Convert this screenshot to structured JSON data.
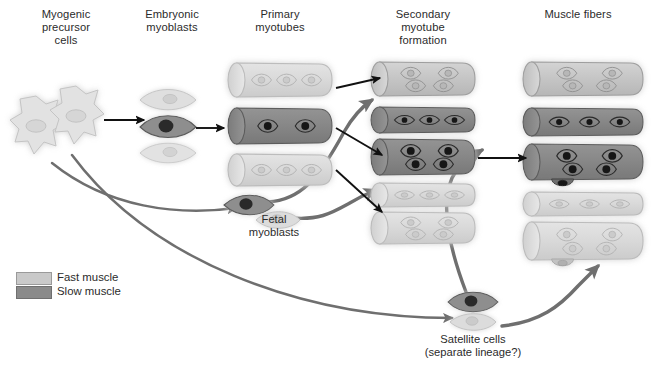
{
  "figure": {
    "title_visible": false,
    "background": "#ffffff",
    "columns": [
      {
        "id": "myogenic-precursor-cells",
        "label": "Myogenic\nprecursor\ncells",
        "x": 18,
        "y": 8,
        "w": 96
      },
      {
        "id": "embryonic-myoblasts",
        "label": "Embryonic\nmyoblasts",
        "x": 124,
        "y": 8,
        "w": 96
      },
      {
        "id": "primary-myotubes",
        "label": "Primary\nmyotubes",
        "x": 238,
        "y": 8,
        "w": 104
      },
      {
        "id": "secondary-myotube-formation",
        "label": "Secondary\nmyotube\nformation",
        "x": 372,
        "y": 8,
        "w": 104
      },
      {
        "id": "muscle-fibers",
        "label": "Muscle fibers",
        "x": 512,
        "y": 8,
        "w": 130
      }
    ],
    "inline_labels": [
      {
        "id": "fetal-myoblasts",
        "label": "Fetal\nmyoblasts",
        "x": 228,
        "y": 213,
        "w": 92
      },
      {
        "id": "satellite-cells",
        "label": "Satellite cells\n(separate lineage?)",
        "x": 406,
        "y": 331,
        "w": 170
      }
    ],
    "legend": {
      "title": "",
      "x": 16,
      "y": 272,
      "items": [
        {
          "id": "fast-muscle",
          "label": "Fast muscle",
          "color": "#c9c9c9",
          "border": "#a6a6a6"
        },
        {
          "id": "slow-muscle",
          "label": "Slow muscle",
          "color": "#8a8a8a",
          "border": "#6f6f6f"
        }
      ]
    },
    "colors": {
      "fast_fill": "#c9c9c9",
      "fast_fill_pale": "#dcdcdc",
      "fast_stroke": "#a8a8a8",
      "slow_fill": "#8a8a8a",
      "slow_stroke": "#5f5f5f",
      "nucleus_dark": "#1f1f1f",
      "nucleus_light": "#bdbdbd",
      "arrow_black": "#111111",
      "arrow_gray": "#707070",
      "text": "#2b2b2b",
      "glow": "#d8d8d8"
    },
    "cells": {
      "precursor": [
        {
          "id": "precursor-cell-1",
          "cx": 36,
          "cy": 130,
          "shade": "pale"
        },
        {
          "id": "precursor-cell-2",
          "cx": 76,
          "cy": 120,
          "shade": "pale"
        }
      ],
      "embryonic_myoblasts": [
        {
          "id": "embryonic-myoblast-top",
          "cx": 168,
          "cy": 100,
          "shade": "pale"
        },
        {
          "id": "embryonic-myoblast-middle",
          "cx": 168,
          "cy": 127,
          "shade": "slow"
        },
        {
          "id": "embryonic-myoblast-bottom",
          "cx": 168,
          "cy": 153,
          "shade": "pale"
        }
      ],
      "fetal_myoblasts": [
        {
          "id": "fetal-myoblast-dark",
          "cx": 248,
          "cy": 205,
          "shade": "slow"
        },
        {
          "id": "fetal-myoblast-light",
          "cx": 277,
          "cy": 220,
          "shade": "pale"
        }
      ],
      "satellite_cells": [
        {
          "id": "satellite-cell-dark",
          "cx": 472,
          "cy": 302,
          "shade": "slow"
        },
        {
          "id": "satellite-cell-light",
          "cx": 472,
          "cy": 322,
          "shade": "pale"
        }
      ]
    },
    "tubes": {
      "primary_myotubes": [
        {
          "id": "primary-myotube-1",
          "x": 228,
          "y": 63,
          "w": 104,
          "h": 34,
          "type": "fast-pale",
          "nuclei": 3,
          "nuclei_rows": 1
        },
        {
          "id": "primary-myotube-2",
          "x": 228,
          "y": 108,
          "w": 104,
          "h": 36,
          "type": "slow",
          "nuclei": 2,
          "nuclei_rows": 1
        },
        {
          "id": "primary-myotube-3",
          "x": 228,
          "y": 154,
          "w": 104,
          "h": 32,
          "type": "fast-pale",
          "nuclei": 3,
          "nuclei_rows": 1
        }
      ],
      "secondary_myotubes": [
        {
          "id": "secondary-myotube-1",
          "x": 371,
          "y": 62,
          "w": 104,
          "h": 34,
          "type": "fast",
          "nuclei": 4,
          "nuclei_rows": 2
        },
        {
          "id": "secondary-myotube-2",
          "x": 371,
          "y": 107,
          "w": 104,
          "h": 26,
          "type": "slow",
          "nuclei": 3,
          "nuclei_rows": 1
        },
        {
          "id": "secondary-myotube-3",
          "x": 371,
          "y": 139,
          "w": 104,
          "h": 36,
          "type": "slow",
          "nuclei": 4,
          "nuclei_rows": 2
        },
        {
          "id": "secondary-myotube-4",
          "x": 371,
          "y": 183,
          "w": 104,
          "h": 24,
          "type": "fast-pale",
          "nuclei": 3,
          "nuclei_rows": 1
        },
        {
          "id": "secondary-myotube-5",
          "x": 371,
          "y": 212,
          "w": 104,
          "h": 32,
          "type": "fast-pale",
          "nuclei": 4,
          "nuclei_rows": 2
        }
      ],
      "muscle_fibers": [
        {
          "id": "muscle-fiber-1",
          "x": 523,
          "y": 62,
          "w": 120,
          "h": 34,
          "type": "fast",
          "nuclei": 4,
          "nuclei_rows": 2,
          "satellite": false
        },
        {
          "id": "muscle-fiber-2",
          "x": 523,
          "y": 108,
          "w": 120,
          "h": 28,
          "type": "slow",
          "nuclei": 3,
          "nuclei_rows": 1,
          "satellite": false
        },
        {
          "id": "muscle-fiber-3",
          "x": 523,
          "y": 144,
          "w": 120,
          "h": 36,
          "type": "slow",
          "nuclei": 4,
          "nuclei_rows": 2,
          "satellite": true
        },
        {
          "id": "muscle-fiber-4",
          "x": 523,
          "y": 192,
          "w": 120,
          "h": 24,
          "type": "fast-pale",
          "nuclei": 3,
          "nuclei_rows": 1,
          "satellite": false
        },
        {
          "id": "muscle-fiber-5",
          "x": 523,
          "y": 222,
          "w": 120,
          "h": 38,
          "type": "fast-pale",
          "nuclei": 4,
          "nuclei_rows": 2,
          "satellite": true
        }
      ]
    },
    "arrows": {
      "black": [
        {
          "id": "arrow-precursor-to-embryonic",
          "from": [
            104,
            120
          ],
          "to": [
            144,
            120
          ]
        },
        {
          "id": "arrow-embryonic-to-primary",
          "from": [
            196,
            128
          ],
          "to": [
            224,
            128
          ]
        },
        {
          "id": "arrow-primary1-to-secondary1",
          "from": [
            336,
            88
          ],
          "to": [
            380,
            78
          ]
        },
        {
          "id": "arrow-primary2-to-secondary3",
          "from": [
            336,
            128
          ],
          "to": [
            382,
            155
          ]
        },
        {
          "id": "arrow-primary3-to-secondary5",
          "from": [
            336,
            170
          ],
          "to": [
            382,
            212
          ]
        },
        {
          "id": "arrow-secondary3-to-fiber3",
          "from": [
            478,
            158
          ],
          "to": [
            526,
            158
          ]
        }
      ],
      "gray_curves": [
        {
          "id": "curve-precursor-to-fetal",
          "label": "precursor to fetal myoblasts"
        },
        {
          "id": "curve-precursor-to-satellite",
          "label": "precursor to satellite cells"
        },
        {
          "id": "curve-fetal-to-secondary2",
          "label": "fetal myoblast to secondary myotube 2"
        },
        {
          "id": "curve-fetal-to-secondary4",
          "label": "fetal myoblast to secondary myotube 4"
        },
        {
          "id": "curve-satellite-to-secondary",
          "label": "satellite cell to secondary myotube region"
        },
        {
          "id": "curve-satellite-to-fiber",
          "label": "satellite cell to muscle fiber"
        }
      ]
    }
  }
}
